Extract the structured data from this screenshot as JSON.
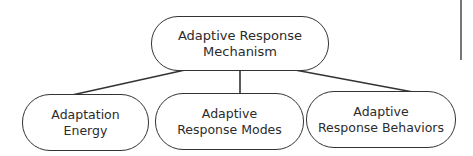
{
  "diagram": {
    "root": {
      "lines": [
        "Adaptive Response",
        "Mechanism"
      ]
    },
    "children": [
      {
        "lines": [
          "Adaptation",
          "Energy"
        ]
      },
      {
        "lines": [
          "Adaptive",
          "Response Modes"
        ]
      },
      {
        "lines": [
          "Adaptive",
          "Response Behaviors"
        ]
      }
    ],
    "edges": [
      {
        "from": "root",
        "to": "children.0"
      },
      {
        "from": "root",
        "to": "children.1"
      },
      {
        "from": "root",
        "to": "children.2"
      }
    ],
    "colors": {
      "stroke": "#333333",
      "text": "#2b2b2b",
      "background": "#ffffff"
    }
  }
}
